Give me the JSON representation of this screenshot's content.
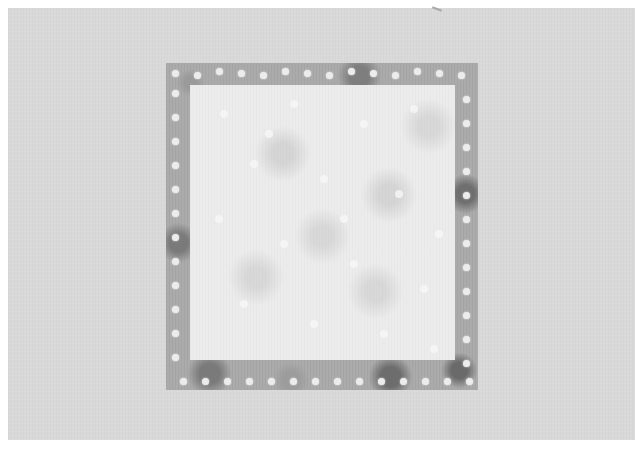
{
  "scene": {
    "description": "Photograph of a square fabric quilt block: a gray polka-dot fabric border framing a lighter square center, laid on a light gray fabric background",
    "colors": {
      "background": "#d9d9d9",
      "frame": "#ababab",
      "inner": "#ececec",
      "dots": "#ececec"
    }
  }
}
